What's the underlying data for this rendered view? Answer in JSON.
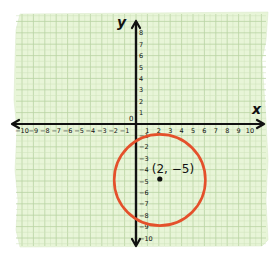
{
  "figure": {
    "paper_color": "#e8f5d8",
    "grid_minor_color": "#cfe3bb",
    "grid_major_color": "#b9d3a3",
    "axis_color": "#111111",
    "circle_color": "#e4502b",
    "point_color": "#111111"
  },
  "axes": {
    "x_label": "x",
    "y_label": "y",
    "origin_label": "0",
    "x_ticks": [
      "-10",
      "-9",
      "-8",
      "-7",
      "-6",
      "-5",
      "-4",
      "-3",
      "-2",
      "-1",
      "1",
      "2",
      "3",
      "4",
      "5",
      "6",
      "7",
      "8",
      "9",
      "10"
    ],
    "y_ticks_positive": [
      "1",
      "2",
      "3",
      "4",
      "5",
      "6",
      "7",
      "8"
    ],
    "y_ticks_negative": [
      "-1",
      "-2",
      "-3",
      "-4",
      "-5",
      "-6",
      "-7",
      "-8",
      "-9",
      "-10"
    ],
    "x_range": [
      -10,
      10
    ],
    "y_range": [
      -10,
      8
    ]
  },
  "point": {
    "x": 2,
    "y": -5,
    "label": "(2, −5)"
  },
  "circle": {
    "center": [
      2,
      -5
    ],
    "radius_units": 4
  }
}
